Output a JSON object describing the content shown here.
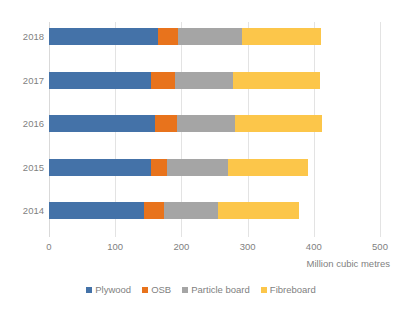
{
  "chart_data": {
    "type": "bar",
    "orientation": "horizontal",
    "stacked": true,
    "title": "",
    "subtitle": "",
    "xlabel": "Million cubic metres",
    "ylabel": "",
    "categories": [
      "2018",
      "2017",
      "2016",
      "2015",
      "2014"
    ],
    "series": [
      {
        "name": "Plywood",
        "color": "#4472a8",
        "values": [
          165,
          154,
          160,
          154,
          144
        ]
      },
      {
        "name": "OSB",
        "color": "#e8731c",
        "values": [
          30,
          36,
          33,
          24,
          30
        ]
      },
      {
        "name": "Particle board",
        "color": "#a5a5a5",
        "values": [
          97,
          88,
          88,
          92,
          82
        ]
      },
      {
        "name": "Fibreboard",
        "color": "#fcc64a",
        "values": [
          119,
          131,
          131,
          121,
          121
        ]
      }
    ],
    "totals": [
      411,
      409,
      412,
      391,
      377
    ],
    "xlim": [
      0,
      500
    ],
    "xticks": [
      0,
      100,
      200,
      300,
      400,
      500
    ],
    "xtick_labels": [
      "0",
      "100",
      "200",
      "300",
      "400",
      "500"
    ],
    "grid": true,
    "grid_axis": "x",
    "legend_position": "bottom"
  },
  "legend": {
    "items": [
      {
        "label": "Plywood"
      },
      {
        "label": "OSB"
      },
      {
        "label": "Particle board"
      },
      {
        "label": "Fibreboard"
      }
    ]
  },
  "axis": {
    "x_title": "Million cubic metres"
  }
}
